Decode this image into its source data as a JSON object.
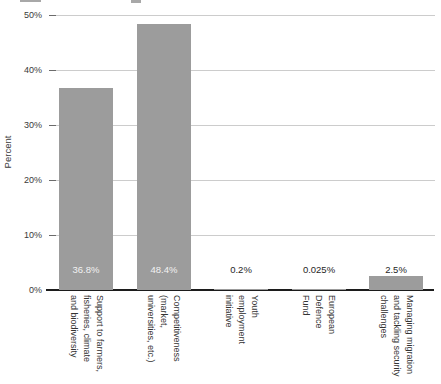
{
  "chart_data": {
    "type": "bar",
    "title": "",
    "xlabel": "",
    "ylabel": "Percent",
    "ylim": [
      0,
      50
    ],
    "grid": "horizontal",
    "legend": "none",
    "colors": {
      "bar": "#9c9c9c",
      "gridline": "#cccccc",
      "axis_line": "#1c1c1c",
      "tick_text": "#3a3a3a",
      "value_label_inside": "#f2f2f2",
      "value_label_outside": "#262626"
    },
    "categories": [
      "Support to farmers,\nfisheries, climate\nand biodiversity",
      "Competitiveness\n(market,\nuniversities, etc.)",
      "Youth\nemployment\ninitiative",
      "European\nDefence\nFund",
      "Managing migration\nand tackling security\nchallenges"
    ],
    "values": [
      36.8,
      48.4,
      0.2,
      0.025,
      2.5
    ],
    "value_labels": [
      "36.8%",
      "48.4%",
      "0.2%",
      "0.025%",
      "2.5%"
    ],
    "value_label_inside": [
      true,
      true,
      false,
      false,
      false
    ],
    "y_ticks": [
      {
        "value": 0,
        "label": "0%"
      },
      {
        "value": 10,
        "label": "10%"
      },
      {
        "value": 20,
        "label": "20%"
      },
      {
        "value": 30,
        "label": "30%"
      },
      {
        "value": 40,
        "label": "40%"
      },
      {
        "value": 50,
        "label": "50%"
      }
    ]
  }
}
